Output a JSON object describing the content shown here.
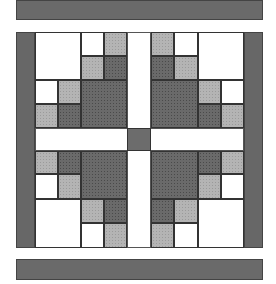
{
  "diagram": {
    "type": "quilt-block",
    "colors": {
      "border_strip": "#6a6a6a",
      "light_fabric": "#b4b4b4",
      "dark_fabric": "#6a6a6a",
      "background_fabric": "#ffffff",
      "center_square": "#6c6c6c"
    },
    "unit_px": 23,
    "quadrant_pattern": [
      [
        "w",
        "w",
        "w",
        "l"
      ],
      [
        "w",
        "w",
        "l",
        "d"
      ],
      [
        "w",
        "l",
        "d",
        "d"
      ],
      [
        "l",
        "d",
        "d",
        "d"
      ]
    ]
  }
}
